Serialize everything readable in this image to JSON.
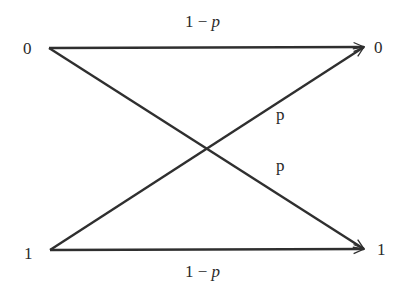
{
  "diagram": {
    "type": "binary-symmetric-channel",
    "colors": {
      "line": "#2f2f2f",
      "text": "#2a2a2a",
      "background": "#ffffff"
    },
    "inputs": [
      {
        "id": "in0",
        "label": "0"
      },
      {
        "id": "in1",
        "label": "1"
      }
    ],
    "outputs": [
      {
        "id": "out0",
        "label": "0"
      },
      {
        "id": "out1",
        "label": "1"
      }
    ],
    "edges": [
      {
        "from": "in0",
        "to": "out0",
        "label_num": "1",
        "label_op": "−",
        "label_var": "p"
      },
      {
        "from": "in1",
        "to": "out0",
        "label_var": "p"
      },
      {
        "from": "in0",
        "to": "out1",
        "label_var": "p"
      },
      {
        "from": "in1",
        "to": "out1",
        "label_num": "1",
        "label_op": "−",
        "label_var": "p"
      }
    ]
  }
}
